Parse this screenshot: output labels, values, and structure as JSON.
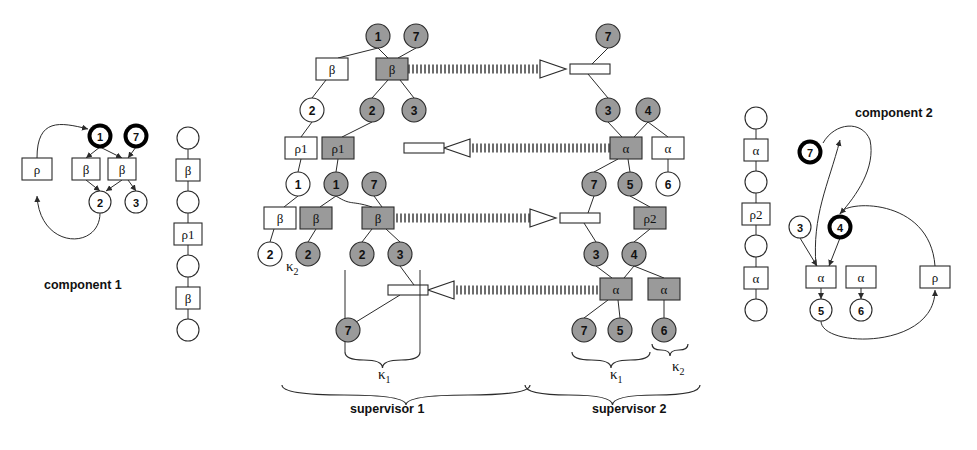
{
  "diagram": {
    "title_hidden": "",
    "colors": {
      "shaded_fill": "#9a9a9a",
      "light_fill": "#ffffff",
      "stroke": "#2b2b2b",
      "bold_node_ring": "#000000",
      "hatch": "#707070"
    },
    "captions": [
      {
        "id": "component-1",
        "text": "component 1",
        "x": 44,
        "y": 278
      },
      {
        "id": "supervisor-1",
        "text": "supervisor 1",
        "x": 350,
        "y": 402
      },
      {
        "id": "supervisor-2",
        "text": "supervisor 2",
        "x": 592,
        "y": 402
      },
      {
        "id": "component-2",
        "text": "component 2",
        "x": 855,
        "y": 106
      }
    ],
    "kappa_labels": [
      {
        "id": "kappa-2-sup1",
        "base": "κ",
        "sub": "2",
        "x": 286,
        "y": 258
      },
      {
        "id": "kappa-1-sup1",
        "base": "κ",
        "sub": "1",
        "x": 378,
        "y": 366
      },
      {
        "id": "kappa-1-sup2",
        "base": "κ",
        "sub": "1",
        "x": 610,
        "y": 366
      },
      {
        "id": "kappa-2-sup2",
        "base": "κ",
        "sub": "2",
        "x": 672,
        "y": 358
      }
    ],
    "component1": {
      "label": "component 1",
      "boxes": [
        {
          "id": "rho-box",
          "text": "ρ",
          "x": 22,
          "y": 158,
          "w": 30,
          "h": 22,
          "shaded": false
        },
        {
          "id": "beta-box-left",
          "text": "β",
          "x": 72,
          "y": 158,
          "w": 28,
          "h": 22,
          "shaded": false
        },
        {
          "id": "beta-box-right",
          "text": "β",
          "x": 108,
          "y": 158,
          "w": 28,
          "h": 22,
          "shaded": false
        }
      ],
      "nodes": [
        {
          "id": "node-1",
          "text": "1",
          "cx": 100,
          "cy": 136,
          "r": 11,
          "bold": true,
          "shaded": false
        },
        {
          "id": "node-7",
          "text": "7",
          "cx": 136,
          "cy": 136,
          "r": 11,
          "bold": true,
          "shaded": false
        },
        {
          "id": "node-2",
          "text": "2",
          "cx": 100,
          "cy": 202,
          "r": 11,
          "bold": false,
          "shaded": false
        },
        {
          "id": "node-3",
          "text": "3",
          "cx": 136,
          "cy": 202,
          "r": 11,
          "bold": false,
          "shaded": false
        }
      ]
    },
    "chain_left": {
      "id": "chain-left",
      "x": 188,
      "items": [
        {
          "kind": "circle",
          "text": "",
          "cy": 138
        },
        {
          "kind": "box",
          "text": "β",
          "cy": 170
        },
        {
          "kind": "circle",
          "text": "",
          "cy": 202
        },
        {
          "kind": "box",
          "text": "ρ1",
          "cy": 234
        },
        {
          "kind": "circle",
          "text": "",
          "cy": 266
        },
        {
          "kind": "box",
          "text": "β",
          "cy": 298
        },
        {
          "kind": "circle",
          "text": "",
          "cy": 330
        }
      ]
    },
    "chain_right": {
      "id": "chain-right",
      "x": 756,
      "items": [
        {
          "kind": "circle",
          "text": "",
          "cy": 118
        },
        {
          "kind": "box",
          "text": "α",
          "cy": 150
        },
        {
          "kind": "circle",
          "text": "",
          "cy": 182
        },
        {
          "kind": "box",
          "text": "ρ2",
          "cy": 214
        },
        {
          "kind": "circle",
          "text": "",
          "cy": 246
        },
        {
          "kind": "box",
          "text": "α",
          "cy": 278
        },
        {
          "kind": "circle",
          "text": "",
          "cy": 310
        }
      ]
    },
    "supervisor1": {
      "label": "supervisor 1",
      "boxes": [
        {
          "id": "s1-beta-white-top",
          "text": "β",
          "x": 316,
          "y": 58,
          "w": 32,
          "h": 22,
          "shaded": false
        },
        {
          "id": "s1-beta-gray-top",
          "text": "β",
          "x": 376,
          "y": 58,
          "w": 32,
          "h": 22,
          "shaded": true
        },
        {
          "id": "s1-rho1-white",
          "text": "ρ1",
          "x": 285,
          "y": 137,
          "w": 32,
          "h": 22,
          "shaded": false
        },
        {
          "id": "s1-rho1-gray",
          "text": "ρ1",
          "x": 322,
          "y": 137,
          "w": 32,
          "h": 22,
          "shaded": true
        },
        {
          "id": "s1-beta-white-bot",
          "text": "β",
          "x": 264,
          "y": 207,
          "w": 32,
          "h": 22,
          "shaded": false
        },
        {
          "id": "s1-beta-gray-bot",
          "text": "β",
          "x": 300,
          "y": 207,
          "w": 32,
          "h": 22,
          "shaded": true
        },
        {
          "id": "s1-beta-gray-mid",
          "text": "β",
          "x": 362,
          "y": 207,
          "w": 32,
          "h": 22,
          "shaded": true
        }
      ],
      "nodes": [
        {
          "id": "s1-n1-top",
          "text": "1",
          "cx": 378,
          "cy": 36,
          "r": 12,
          "shaded": true
        },
        {
          "id": "s1-n7-top",
          "text": "7",
          "cx": 416,
          "cy": 36,
          "r": 12,
          "shaded": true
        },
        {
          "id": "s1-n2-white",
          "text": "2",
          "cx": 312,
          "cy": 110,
          "r": 12,
          "shaded": false
        },
        {
          "id": "s1-n2-gray",
          "text": "2",
          "cx": 372,
          "cy": 110,
          "r": 12,
          "shaded": true
        },
        {
          "id": "s1-n3-gray",
          "text": "3",
          "cx": 414,
          "cy": 110,
          "r": 12,
          "shaded": true
        },
        {
          "id": "s1-n1-white",
          "text": "1",
          "cx": 298,
          "cy": 184,
          "r": 12,
          "shaded": false
        },
        {
          "id": "s1-n1-gray",
          "text": "1",
          "cx": 336,
          "cy": 184,
          "r": 12,
          "shaded": true
        },
        {
          "id": "s1-n7-gray",
          "text": "7",
          "cx": 374,
          "cy": 184,
          "r": 12,
          "shaded": true
        },
        {
          "id": "s1-n2-white-bot",
          "text": "2",
          "cx": 270,
          "cy": 254,
          "r": 12,
          "shaded": false
        },
        {
          "id": "s1-n2-gray-bot",
          "text": "2",
          "cx": 308,
          "cy": 254,
          "r": 12,
          "shaded": true
        },
        {
          "id": "s1-n2-gray-low",
          "text": "2",
          "cx": 362,
          "cy": 254,
          "r": 12,
          "shaded": true
        },
        {
          "id": "s1-n3-gray-low",
          "text": "3",
          "cx": 400,
          "cy": 254,
          "r": 12,
          "shaded": true
        },
        {
          "id": "s1-n7-gray-low",
          "text": "7",
          "cx": 348,
          "cy": 330,
          "r": 12,
          "shaded": true
        }
      ]
    },
    "supervisor2": {
      "label": "supervisor 2",
      "boxes": [
        {
          "id": "s2-alpha-gray-top",
          "text": "α",
          "x": 610,
          "y": 137,
          "w": 32,
          "h": 22,
          "shaded": true
        },
        {
          "id": "s2-alpha-white-top",
          "text": "α",
          "x": 652,
          "y": 137,
          "w": 32,
          "h": 22,
          "shaded": false
        },
        {
          "id": "s2-rho2-gray",
          "text": "ρ2",
          "x": 634,
          "y": 207,
          "w": 32,
          "h": 22,
          "shaded": true
        },
        {
          "id": "s2-alpha-gray-bot",
          "text": "α",
          "x": 600,
          "y": 278,
          "w": 32,
          "h": 22,
          "shaded": true
        },
        {
          "id": "s2-alpha-gray-bot2",
          "text": "α",
          "x": 648,
          "y": 278,
          "w": 32,
          "h": 22,
          "shaded": true
        }
      ],
      "nodes": [
        {
          "id": "s2-n7-top",
          "text": "7",
          "cx": 608,
          "cy": 36,
          "r": 12,
          "shaded": true
        },
        {
          "id": "s2-n3-top",
          "text": "3",
          "cx": 608,
          "cy": 110,
          "r": 12,
          "shaded": true
        },
        {
          "id": "s2-n4-top",
          "text": "4",
          "cx": 648,
          "cy": 110,
          "r": 12,
          "shaded": true
        },
        {
          "id": "s2-n6-white",
          "text": "6",
          "cx": 668,
          "cy": 184,
          "r": 12,
          "shaded": false
        },
        {
          "id": "s2-n7-mid",
          "text": "7",
          "cx": 594,
          "cy": 184,
          "r": 12,
          "shaded": true
        },
        {
          "id": "s2-n5-mid",
          "text": "5",
          "cx": 630,
          "cy": 184,
          "r": 12,
          "shaded": true
        },
        {
          "id": "s2-n3-bot",
          "text": "3",
          "cx": 596,
          "cy": 254,
          "r": 12,
          "shaded": true
        },
        {
          "id": "s2-n4-bot",
          "text": "4",
          "cx": 634,
          "cy": 254,
          "r": 12,
          "shaded": true
        },
        {
          "id": "s2-n7-low",
          "text": "7",
          "cx": 584,
          "cy": 330,
          "r": 12,
          "shaded": true
        },
        {
          "id": "s2-n5-low",
          "text": "5",
          "cx": 620,
          "cy": 330,
          "r": 12,
          "shaded": true
        },
        {
          "id": "s2-n6-low",
          "text": "6",
          "cx": 664,
          "cy": 330,
          "r": 12,
          "shaded": true
        }
      ]
    },
    "channels": [
      {
        "id": "channel-1-right",
        "x1": 408,
        "x2": 566,
        "y": 69,
        "direction": "right"
      },
      {
        "id": "channel-2-left",
        "x1": 444,
        "x2": 610,
        "y": 148,
        "direction": "left"
      },
      {
        "id": "channel-3-right",
        "x1": 394,
        "x2": 556,
        "y": 218,
        "direction": "right"
      },
      {
        "id": "channel-4-left",
        "x1": 428,
        "x2": 600,
        "y": 290,
        "direction": "left"
      }
    ],
    "ports": [
      {
        "id": "port-s2-top",
        "x": 570,
        "y": 64,
        "w": 40,
        "h": 10
      },
      {
        "id": "port-s1-mid",
        "x": 404,
        "y": 143,
        "w": 40,
        "h": 10
      },
      {
        "id": "port-s2-mid",
        "x": 560,
        "y": 213,
        "w": 40,
        "h": 10
      },
      {
        "id": "port-s1-low",
        "x": 388,
        "y": 285,
        "w": 40,
        "h": 10
      }
    ],
    "component2": {
      "label": "component 2",
      "boxes": [
        {
          "id": "c2-alpha-left",
          "text": "α",
          "x": 806,
          "y": 266,
          "w": 30,
          "h": 22,
          "shaded": false
        },
        {
          "id": "c2-alpha-right",
          "text": "α",
          "x": 846,
          "y": 266,
          "w": 30,
          "h": 22,
          "shaded": false
        },
        {
          "id": "c2-rho",
          "text": "ρ",
          "x": 920,
          "y": 266,
          "w": 30,
          "h": 22,
          "shaded": false
        }
      ],
      "nodes": [
        {
          "id": "c2-node-7",
          "text": "7",
          "cx": 810,
          "cy": 152,
          "r": 11,
          "bold": true
        },
        {
          "id": "c2-node-3",
          "text": "3",
          "cx": 800,
          "cy": 227,
          "r": 11,
          "bold": false
        },
        {
          "id": "c2-node-4",
          "text": "4",
          "cx": 840,
          "cy": 227,
          "r": 11,
          "bold": true
        },
        {
          "id": "c2-node-5",
          "text": "5",
          "cx": 821,
          "cy": 310,
          "r": 11,
          "bold": false
        },
        {
          "id": "c2-node-6",
          "text": "6",
          "cx": 861,
          "cy": 310,
          "r": 11,
          "bold": false
        }
      ]
    }
  }
}
